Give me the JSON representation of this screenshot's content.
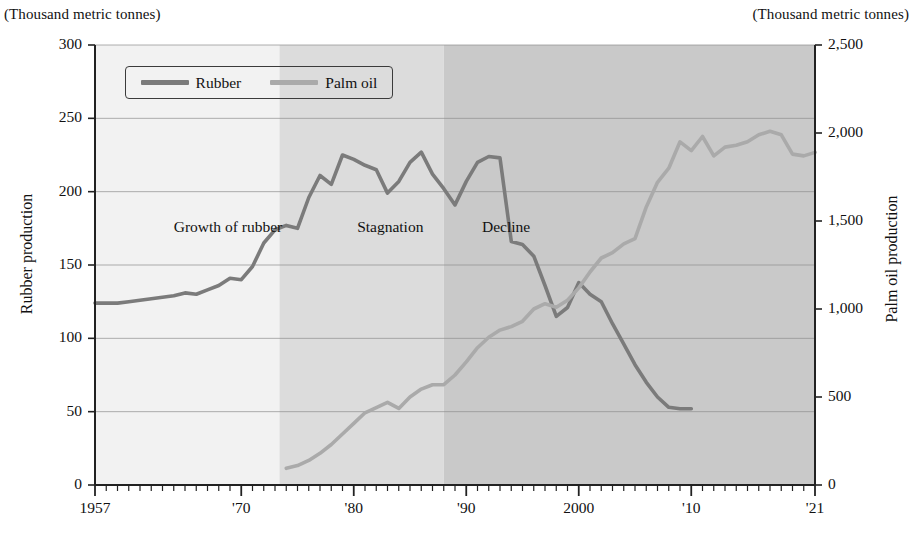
{
  "units": {
    "left": "(Thousand metric tonnes)",
    "right": "(Thousand metric tonnes)"
  },
  "axis_titles": {
    "left": "Rubber production",
    "right": "Palm oil production"
  },
  "legend": {
    "position": "top-left-inside",
    "items": [
      {
        "label": "Rubber",
        "color": "#7b7b7b"
      },
      {
        "label": "Palm oil",
        "color": "#aaaaaa"
      }
    ]
  },
  "annotations": [
    {
      "text": "Growth of rubber",
      "year": 1964.0,
      "value": 182
    },
    {
      "text": "Stagnation",
      "year": 1980.3,
      "value": 182
    },
    {
      "text": "Decline",
      "year": 1991.4,
      "value": 182
    }
  ],
  "bands": [
    {
      "name": "Growth of rubber",
      "from": 1957,
      "to": 1973.4,
      "color": "#f2f2f2"
    },
    {
      "name": "Stagnation",
      "from": 1973.4,
      "to": 1988.0,
      "color": "#dcdcdc"
    },
    {
      "name": "Decline",
      "from": 1988.0,
      "to": 2021,
      "color": "#c9c9c9"
    }
  ],
  "chart_data": {
    "type": "line",
    "title": "",
    "subtitle": "",
    "xlabel": "",
    "ylabel": "Rubber production",
    "y2label": "Palm oil production",
    "xlim": [
      1957,
      2021
    ],
    "ylim": [
      0,
      300
    ],
    "y2lim": [
      0,
      2500
    ],
    "grid": true,
    "x_tick_labels": [
      "1957",
      "'70",
      "'80",
      "'90",
      "2000",
      "'10",
      "'21"
    ],
    "x_tick_years": [
      1957,
      1970,
      1980,
      1990,
      2000,
      2010,
      2021
    ],
    "x_minor_tick_interval": 1,
    "y_tick_labels": [
      "0",
      "50",
      "100",
      "150",
      "200",
      "250",
      "300"
    ],
    "y_tick_values": [
      0,
      50,
      100,
      150,
      200,
      250,
      300
    ],
    "y2_tick_labels": [
      "0",
      "500",
      "1,000",
      "1,500",
      "2,000",
      "2,500"
    ],
    "y2_tick_values": [
      0,
      500,
      1000,
      1500,
      2000,
      2500
    ],
    "series": [
      {
        "name": "Rubber",
        "axis": "left",
        "color": "#7b7b7b",
        "units": "Thousand metric tonnes",
        "x": [
          1957,
          1958,
          1959,
          1960,
          1961,
          1962,
          1963,
          1964,
          1965,
          1966,
          1967,
          1968,
          1969,
          1970,
          1971,
          1972,
          1973,
          1974,
          1975,
          1976,
          1977,
          1978,
          1979,
          1980,
          1981,
          1982,
          1983,
          1984,
          1985,
          1986,
          1987,
          1988,
          1989,
          1990,
          1991,
          1992,
          1993,
          1994,
          1995,
          1996,
          1997,
          1998,
          1999,
          2000,
          2001,
          2002,
          2003,
          2004
        ],
        "values": [
          124,
          124,
          124,
          125,
          126,
          127,
          128,
          129,
          131,
          130,
          133,
          136,
          141,
          140,
          149,
          165,
          174,
          177,
          175,
          196,
          211,
          205,
          225,
          222,
          218,
          215,
          199,
          207,
          220,
          227,
          212,
          202,
          191,
          207,
          220,
          224,
          223,
          166,
          164,
          156,
          136,
          115,
          121,
          138,
          130,
          125,
          110,
          96
        ],
        "values_tail": [
          82,
          70,
          60,
          53,
          52,
          52
        ]
      },
      {
        "name": "Palm oil",
        "axis": "right",
        "color": "#aaaaaa",
        "units": "Thousand metric tonnes",
        "x": [
          1974,
          1975,
          1976,
          1977,
          1978,
          1979,
          1980,
          1981,
          1982,
          1983,
          1984,
          1985,
          1986,
          1987,
          1988,
          1989,
          1990,
          1991,
          1992,
          1993,
          1994,
          1995,
          1996,
          1997,
          1998,
          1999,
          2000,
          2001,
          2002,
          2003,
          2004,
          2005,
          2006,
          2007,
          2008,
          2009,
          2010,
          2011,
          2012,
          2013,
          2014,
          2015,
          2016,
          2017,
          2018,
          2019,
          2020,
          2021
        ],
        "values": [
          95,
          110,
          140,
          180,
          230,
          290,
          350,
          410,
          440,
          470,
          435,
          500,
          545,
          570,
          570,
          625,
          700,
          780,
          840,
          880,
          900,
          930,
          1000,
          1030,
          1010,
          1050,
          1120,
          1210,
          1290,
          1320,
          1370,
          1400,
          1580,
          1720,
          1800,
          1950,
          1900,
          1980,
          1870,
          1920,
          1930,
          1950,
          1990,
          2010,
          1990,
          1880,
          1870,
          1890
        ]
      }
    ]
  }
}
